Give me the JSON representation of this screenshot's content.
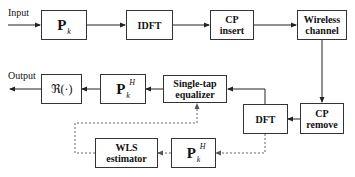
{
  "diagram": {
    "input_label": "Input",
    "output_label": "Output",
    "blocks": {
      "pk": {
        "main": "P",
        "sub": "k"
      },
      "idft": {
        "label": "IDFT"
      },
      "cp_insert": {
        "line1": "CP",
        "line2": "insert"
      },
      "wireless_channel": {
        "line1": "Wireless",
        "line2": "channel"
      },
      "cp_remove": {
        "line1": "CP",
        "line2": "remove"
      },
      "dft": {
        "label": "DFT"
      },
      "equalizer": {
        "line1": "Single-tap",
        "line2": "equalizer"
      },
      "pkh_top": {
        "main": "P",
        "sub": "k",
        "sup": "H"
      },
      "real_part": {
        "label": "ℜ(·)"
      },
      "wls_estimator": {
        "line1": "WLS",
        "line2": "estimator"
      },
      "pkh_bottom": {
        "main": "P",
        "sub": "k",
        "sup": "H"
      }
    },
    "colors": {
      "line": "#333333",
      "dashed": "#777777",
      "background": "#ffffff"
    }
  }
}
